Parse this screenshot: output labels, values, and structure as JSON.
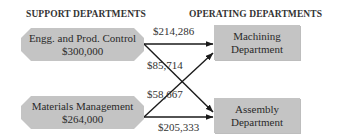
{
  "headings": {
    "support": "SUPPORT DEPARTMENTS",
    "operating": "OPERATING DEPARTMENTS"
  },
  "support_departments": [
    {
      "name": "Engg. and Prod. Control",
      "amount": "$300,000"
    },
    {
      "name": "Materials Management",
      "amount": "$264,000"
    }
  ],
  "operating_departments": [
    {
      "name_line1": "Machining",
      "name_line2": "Department"
    },
    {
      "name_line1": "Assembly",
      "name_line2": "Department"
    }
  ],
  "allocations": [
    {
      "from": "Engg. and Prod. Control",
      "to": "Machining Department",
      "amount": "$214,286"
    },
    {
      "from": "Engg. and Prod. Control",
      "to": "Assembly Department",
      "amount": "$85,714"
    },
    {
      "from": "Materials Management",
      "to": "Machining Department",
      "amount": "$58,667"
    },
    {
      "from": "Materials Management",
      "to": "Assembly Department",
      "amount": "$205,333"
    }
  ],
  "colors": {
    "box_fill": "#c4c4c4",
    "line": "#1a1a1a",
    "text": "#2a2a2a"
  }
}
